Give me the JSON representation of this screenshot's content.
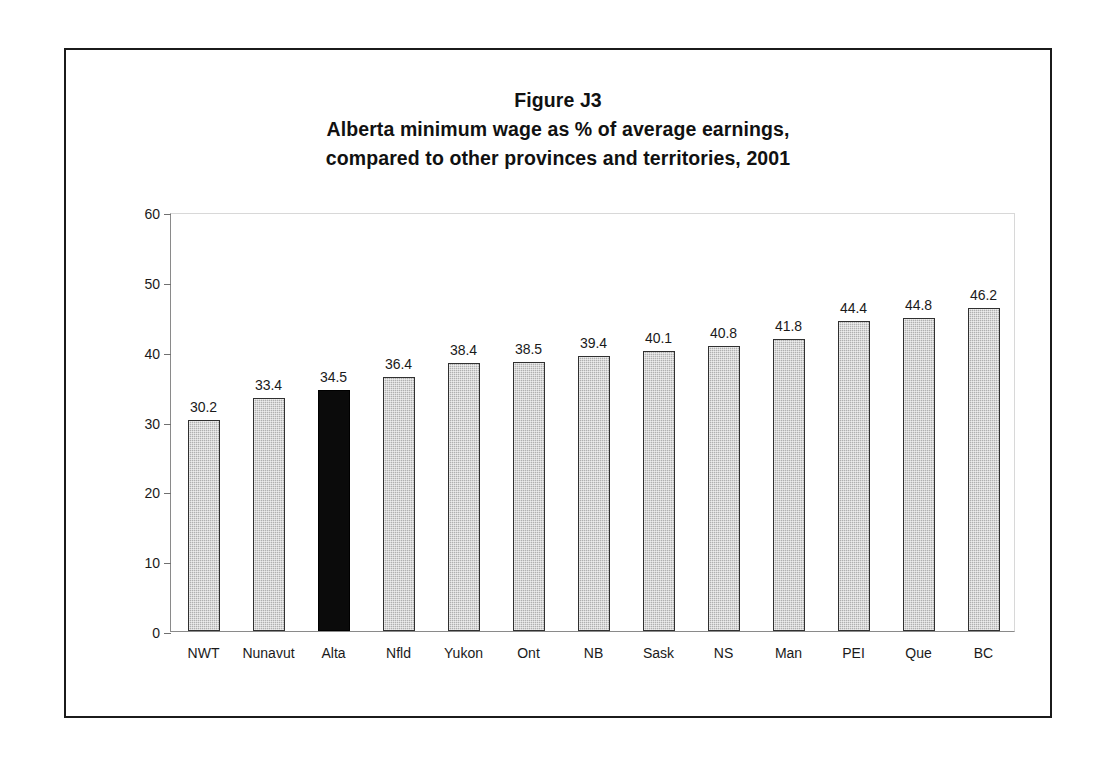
{
  "figure": {
    "title_lines": [
      "Figure J3",
      "Alberta minimum wage as % of average earnings,",
      "compared to other provinces and territories, 2001"
    ]
  },
  "chart_data": {
    "type": "bar",
    "xlabel": "",
    "ylabel": "",
    "ylim": [
      0,
      60
    ],
    "yticks": [
      0,
      10,
      20,
      30,
      40,
      50,
      60
    ],
    "grid": false,
    "legend": "none",
    "categories": [
      "NWT",
      "Nunavut",
      "Alta",
      "Nfld",
      "Yukon",
      "Ont",
      "NB",
      "Sask",
      "NS",
      "Man",
      "PEI",
      "Que",
      "BC"
    ],
    "values": [
      30.2,
      33.4,
      34.5,
      36.4,
      38.4,
      38.5,
      39.4,
      40.1,
      40.8,
      41.8,
      44.4,
      44.8,
      46.2
    ],
    "value_labels": [
      "30.2",
      "33.4",
      "34.5",
      "36.4",
      "38.4",
      "38.5",
      "39.4",
      "40.1",
      "40.8",
      "41.8",
      "44.4",
      "44.8",
      "46.2"
    ],
    "highlight_category": "Alta",
    "colors": {
      "bar_fill": "#b0b0b0",
      "bar_edge": "#303030",
      "highlight_fill": "#0b0b0b",
      "axis": "#8a8a8a",
      "text": "#1a1a1a",
      "frame": "#1b1b1b",
      "background": "#ffffff"
    }
  }
}
